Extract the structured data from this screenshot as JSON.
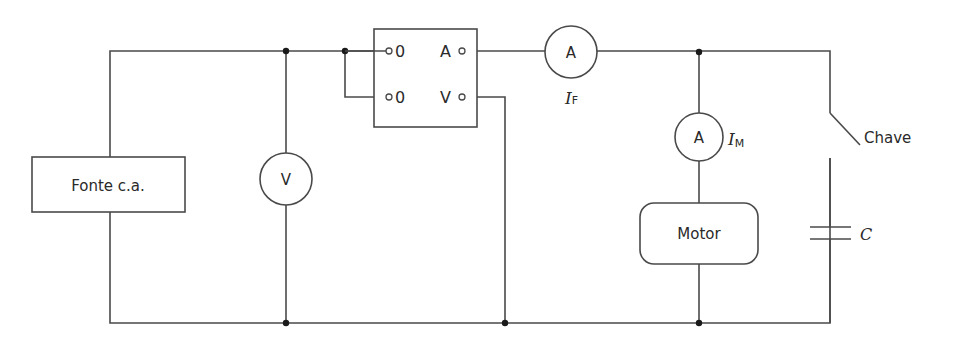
{
  "diagram": {
    "type": "circuit",
    "colors": {
      "line": "#4a4a4a",
      "junction": "#1a1a1a",
      "text": "#2a2a2a",
      "background": "#ffffff"
    },
    "source": {
      "label": "Fonte c.a."
    },
    "voltmeter": {
      "symbol": "V"
    },
    "selector_switch": {
      "left_terminals": [
        "0",
        "0"
      ],
      "right_terminals": [
        "A",
        "V"
      ]
    },
    "ammeter_feed": {
      "symbol": "A",
      "label_main": "I",
      "label_sub": "F"
    },
    "ammeter_motor": {
      "symbol": "A",
      "label_main": "I",
      "label_sub": "M"
    },
    "motor": {
      "label": "Motor"
    },
    "switch": {
      "label": "Chave"
    },
    "capacitor": {
      "label": "C"
    }
  }
}
